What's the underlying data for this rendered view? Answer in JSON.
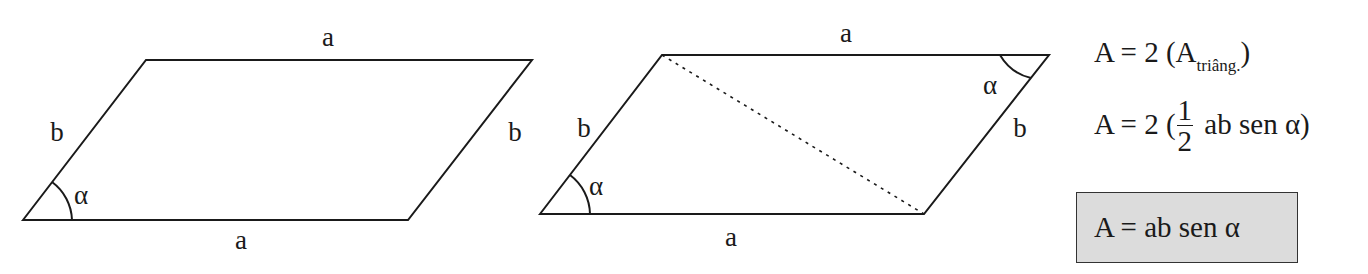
{
  "figure_1": {
    "type": "parallelogram",
    "labels": {
      "top": "a",
      "bottom": "a",
      "left": "b",
      "right": "b",
      "angle": "α"
    }
  },
  "figure_2": {
    "type": "parallelogram-with-diagonal",
    "labels": {
      "top": "a",
      "bottom": "a",
      "left": "b",
      "right": "b",
      "angle_bottom_left": "α",
      "angle_top_right": "α"
    }
  },
  "formulas": {
    "line1": {
      "prefix": "A = 2 (A",
      "subscript": "triâng.",
      "suffix": ")"
    },
    "line2": {
      "prefix": "A = 2  (",
      "frac_num": "1",
      "frac_den": "2",
      "suffix": " ab sen α)"
    },
    "result": "A = ab sen  α"
  },
  "colors": {
    "stroke": "#1a1a1a",
    "box_fill": "#dcdcdc",
    "background": "#ffffff"
  }
}
